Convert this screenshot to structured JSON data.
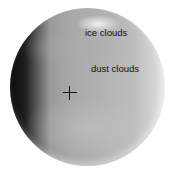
{
  "image": {
    "subject": "planet (Mars) grayscale globe",
    "background": "#ffffff"
  },
  "labels": [
    {
      "text": "ice clouds",
      "x": 85,
      "y": 28
    },
    {
      "text": "dust clouds",
      "x": 91,
      "y": 64
    }
  ],
  "marker": {
    "type": "crosshair",
    "x": 70,
    "y": 93
  }
}
